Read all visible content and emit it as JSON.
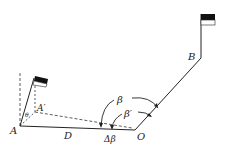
{
  "diagram": {
    "title": "",
    "colors": {
      "line": "#222222",
      "flag": "#111111",
      "background": "#ffffff"
    },
    "labels": {
      "A": "A",
      "A_prime": "A′",
      "O": "O",
      "B": "B",
      "D": "D",
      "beta": "β",
      "beta_prime": "β′",
      "delta_beta": "Δβ",
      "theta": "θ"
    },
    "points": {
      "A": [
        20,
        126
      ],
      "A_prime": [
        35,
        112
      ],
      "O": [
        135,
        130
      ],
      "B": [
        201,
        58
      ]
    },
    "icons": [
      "flag-icon-at-A",
      "flag-icon-at-B"
    ]
  }
}
